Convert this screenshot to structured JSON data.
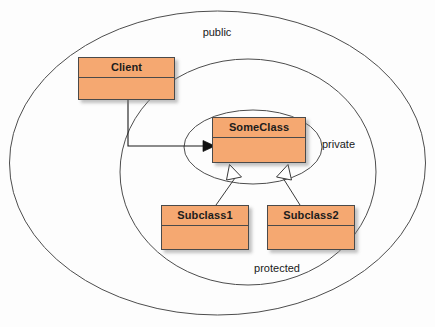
{
  "diagram": {
    "type": "uml-class-diagram",
    "background_color": "#fdfdfd",
    "class_fill_color": "#f5a871",
    "class_border_color": "#4a4a4a",
    "ellipse_stroke_color": "#4d4d4d"
  },
  "scopes": [
    {
      "id": "public",
      "label": "public",
      "label_x": 217,
      "label_y": 36,
      "cx": 217.5,
      "cy": 163,
      "rx": 208,
      "ry": 152
    },
    {
      "id": "protected",
      "label": "protected",
      "label_x": 277,
      "label_y": 272,
      "cx": 248,
      "cy": 172,
      "rx": 128,
      "ry": 113
    },
    {
      "id": "private",
      "label": "private",
      "label_x": 322,
      "label_y": 148,
      "cx": 253,
      "cy": 147,
      "rx": 69,
      "ry": 37
    }
  ],
  "classes": [
    {
      "id": "client",
      "name": "Client",
      "x": 78,
      "y": 57,
      "width": 97,
      "height": 43,
      "title_height": 20,
      "scope": "public"
    },
    {
      "id": "someclass",
      "name": "SomeClass",
      "x": 212,
      "y": 117,
      "width": 94,
      "height": 46,
      "title_height": 20,
      "scope": "private"
    },
    {
      "id": "subclass1",
      "name": "Subclass1",
      "x": 161,
      "y": 205,
      "width": 88,
      "height": 45,
      "title_height": 20,
      "scope": "protected"
    },
    {
      "id": "subclass2",
      "name": "Subclass2",
      "x": 267,
      "y": 205,
      "width": 88,
      "height": 45,
      "title_height": 20,
      "scope": "protected"
    },
    {
      "id": "someclass2",
      "name": "SomeClass2"
    }
  ],
  "connections": [
    {
      "id": "client-to-someclass",
      "from": "client",
      "to": "someclass",
      "kind": "dependency",
      "arrowhead": "solid-filled",
      "path": "M 128 100 L 128 146 L 203 146",
      "arrow_points": "203,140.5 215,146 203,151.5"
    },
    {
      "id": "subclass1-to-someclass",
      "from": "subclass1",
      "to": "someclass",
      "kind": "generalization",
      "arrowhead": "hollow-triangle",
      "path": "M 216 205 L 235 178",
      "arrow_points": "229.5,164.5 241.5,177 226.5,180"
    },
    {
      "id": "subclass2-to-someclass",
      "from": "subclass2",
      "to": "someclass",
      "kind": "generalization",
      "arrowhead": "hollow-triangle",
      "path": "M 300 205 L 283 178",
      "arrow_points": "288,164.5 276.5,177 291.5,180"
    }
  ]
}
